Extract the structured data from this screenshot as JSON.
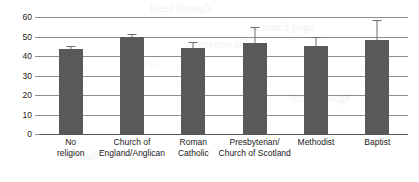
{
  "chart_data": {
    "type": "bar",
    "title": "",
    "xlabel": "",
    "ylabel": "",
    "ylim": [
      0,
      60
    ],
    "yticks": [
      0,
      10,
      20,
      30,
      40,
      50,
      60
    ],
    "ytick_labels": [
      "0",
      "10",
      "20",
      "30",
      "40",
      "50",
      "60"
    ],
    "grid": true,
    "legend": null,
    "categories": [
      "No\nreligion",
      "Church of\nEngland/Anglican",
      "Roman\nCatholic",
      "Presbyterian/\nChurch of Scotland",
      "Methodist",
      "Baptist"
    ],
    "categories_flat": [
      "No religion",
      "Church of England/Anglican",
      "Roman Catholic",
      "Presbyterian/Church of Scotland",
      "Methodist",
      "Baptist"
    ],
    "values": [
      43.5,
      49.5,
      44.0,
      46.5,
      45.0,
      48.0
    ],
    "error_upper": [
      45.0,
      51.5,
      47.0,
      55.0,
      50.0,
      58.5
    ],
    "error_bars": [
      1.5,
      2.0,
      3.0,
      8.5,
      5.0,
      10.5
    ],
    "bar_color": "#595959",
    "error_color": "#6d6d6d",
    "grid_color": "#8d8d8d",
    "axis_color": "#555555",
    "background": "#ffffff"
  },
  "artifacts": {
    "ghost_text": [
      "bleed through",
      "scanned page",
      "reverse side",
      "faint text",
      "show through",
      "overleaf"
    ]
  }
}
